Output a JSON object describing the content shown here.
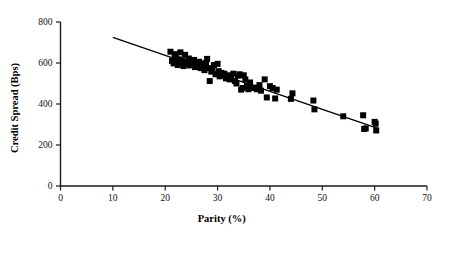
{
  "chart_data": {
    "type": "scatter",
    "title": "",
    "xlabel": "Parity (%)",
    "ylabel": "Credit Spread (Bps)",
    "xlim": [
      0,
      70
    ],
    "ylim": [
      0,
      800
    ],
    "xticks": [
      0,
      10,
      20,
      30,
      40,
      50,
      60,
      70
    ],
    "yticks": [
      0,
      200,
      400,
      600,
      800
    ],
    "xtick_labels": [
      "0",
      "10",
      "20",
      "30",
      "40",
      "50",
      "60",
      "70"
    ],
    "ytick_labels": [
      "0",
      "200",
      "400",
      "600",
      "800"
    ],
    "grid": false,
    "legend": null,
    "marker_style": "filled-square",
    "marker_color": "#000000",
    "marker_size_px": 6,
    "series": [
      {
        "name": "Credit spread vs parity",
        "points": [
          [
            21.0,
            655
          ],
          [
            21.3,
            610
          ],
          [
            21.6,
            598
          ],
          [
            21.8,
            628
          ],
          [
            22.0,
            643
          ],
          [
            22.2,
            607
          ],
          [
            22.4,
            590
          ],
          [
            22.6,
            618
          ],
          [
            22.9,
            652
          ],
          [
            23.1,
            600
          ],
          [
            23.3,
            612
          ],
          [
            23.5,
            585
          ],
          [
            23.8,
            640
          ],
          [
            24.0,
            604
          ],
          [
            24.2,
            596
          ],
          [
            24.5,
            622
          ],
          [
            24.7,
            588
          ],
          [
            25.0,
            608
          ],
          [
            25.2,
            594
          ],
          [
            25.5,
            615
          ],
          [
            25.7,
            580
          ],
          [
            26.0,
            600
          ],
          [
            26.2,
            587
          ],
          [
            26.5,
            606
          ],
          [
            26.8,
            575
          ],
          [
            27.0,
            597
          ],
          [
            27.2,
            583
          ],
          [
            27.5,
            565
          ],
          [
            27.8,
            600
          ],
          [
            28.0,
            620
          ],
          [
            28.2,
            575
          ],
          [
            28.5,
            512
          ],
          [
            28.8,
            558
          ],
          [
            29.0,
            570
          ],
          [
            29.3,
            590
          ],
          [
            29.6,
            545
          ],
          [
            30.0,
            596
          ],
          [
            30.2,
            560
          ],
          [
            30.4,
            535
          ],
          [
            30.7,
            552
          ],
          [
            31.0,
            541
          ],
          [
            31.3,
            548
          ],
          [
            31.6,
            525
          ],
          [
            32.0,
            540
          ],
          [
            32.3,
            520
          ],
          [
            32.6,
            532
          ],
          [
            33.0,
            548
          ],
          [
            33.3,
            512
          ],
          [
            33.6,
            500
          ],
          [
            33.9,
            538
          ],
          [
            34.2,
            545
          ],
          [
            34.5,
            470
          ],
          [
            34.8,
            478
          ],
          [
            35.0,
            540
          ],
          [
            35.3,
            520
          ],
          [
            35.6,
            488
          ],
          [
            35.9,
            472
          ],
          [
            36.2,
            505
          ],
          [
            36.5,
            478
          ],
          [
            37.0,
            480
          ],
          [
            37.5,
            472
          ],
          [
            38.0,
            492
          ],
          [
            38.3,
            465
          ],
          [
            39.0,
            520
          ],
          [
            39.4,
            432
          ],
          [
            40.0,
            487
          ],
          [
            40.5,
            478
          ],
          [
            41.0,
            427
          ],
          [
            41.3,
            470
          ],
          [
            44.0,
            425
          ],
          [
            44.3,
            452
          ],
          [
            48.3,
            417
          ],
          [
            48.5,
            374
          ],
          [
            54.0,
            340
          ],
          [
            57.8,
            345
          ],
          [
            58.0,
            278
          ],
          [
            58.3,
            281
          ],
          [
            60.0,
            313
          ],
          [
            60.2,
            304
          ],
          [
            60.3,
            271
          ]
        ]
      }
    ],
    "trend_line": {
      "name": "linear fit",
      "x_start": 10.0,
      "y_start": 725,
      "x_end": 60.6,
      "y_end": 281
    }
  }
}
